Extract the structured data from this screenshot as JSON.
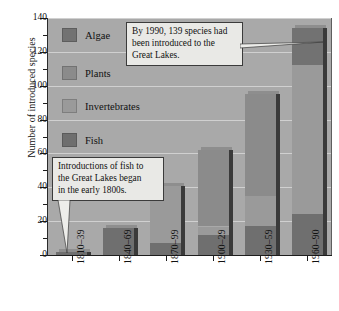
{
  "chart_data": {
    "type": "bar",
    "stacked": true,
    "title": "",
    "xlabel": "",
    "ylabel": "Number of introduced species",
    "ylim": [
      0,
      140
    ],
    "ytick_step": 20,
    "yticks": [
      0,
      20,
      40,
      60,
      80,
      100,
      120,
      140
    ],
    "ytick_labels": [
      "0",
      "20",
      "40",
      "60",
      "80",
      "100",
      "120",
      "140"
    ],
    "minor_tick_step": 10,
    "grid": true,
    "grid_axis": "y",
    "legend_position": "inside-upper-left",
    "categories": [
      "1810–39",
      "1840–69",
      "1870–99",
      "1900–29",
      "1930–59",
      "1960–90"
    ],
    "series": [
      {
        "name": "Fish",
        "color": "#6f6f6f",
        "values": [
          2,
          16,
          7,
          12,
          17,
          24
        ]
      },
      {
        "name": "Invertebrates",
        "color": "#9a9a9a",
        "values": [
          0,
          0,
          34,
          5,
          18,
          88
        ]
      },
      {
        "name": "Plants",
        "color": "#8b8b8b",
        "values": [
          0,
          0,
          0,
          45,
          60,
          0
        ]
      },
      {
        "name": "Algae",
        "color": "#727272",
        "values": [
          0,
          0,
          0,
          0,
          0,
          22
        ]
      }
    ],
    "totals": [
      2,
      16,
      41,
      62,
      95,
      134
    ],
    "annotations": [
      {
        "id": "callout-1990",
        "text": "By 1990, 139 species had been introduced to the Great Lakes.",
        "lines": [
          "By 1990, 139 species had",
          "been introduced to the",
          "Great Lakes."
        ],
        "points_to": "1960–90"
      },
      {
        "id": "callout-fish",
        "text": "Introductions of fish to the Great Lakes began in the early 1800s.",
        "lines": [
          "Introductions of fish to",
          "the Great Lakes began",
          "in the early 1800s."
        ],
        "points_to": "1810–39"
      }
    ]
  },
  "legend": {
    "items": [
      {
        "label": "Algae",
        "color": "#727272"
      },
      {
        "label": "Plants",
        "color": "#8b8b8b"
      },
      {
        "label": "Invertebrates",
        "color": "#9a9a9a"
      },
      {
        "label": "Fish",
        "color": "#6f6f6f"
      }
    ]
  },
  "colors": {
    "plot_background": "#a9a9a9",
    "page_background": "#ffffff",
    "gridline": "#d7d7d7",
    "axis": "#1d1d1d",
    "callout_background": "#e9e9e6",
    "callout_border": "#3b3b3b",
    "bar_shadow": "#3a3a3a"
  }
}
